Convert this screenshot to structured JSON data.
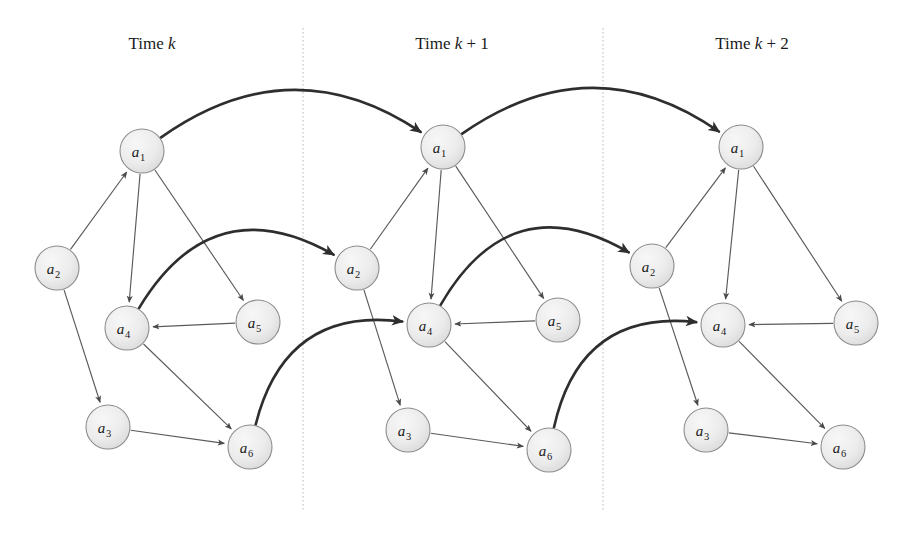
{
  "figure": {
    "background_color": "#ffffff",
    "node_fill": "#e9e9e9",
    "node_stroke": "#8c8c8c",
    "thin_edge_color": "#5a5a5a",
    "thick_edge_color": "#2e2e2e",
    "divider_color": "#b9b9b9",
    "node_radius": 22
  },
  "slices": [
    {
      "id": "slice-k",
      "label_prefix": "Time ",
      "label_var": "k",
      "label_suffix": "",
      "label_full": "Time k",
      "label_x": 152,
      "label_y": 45,
      "origin_x": 0,
      "nodes": [
        {
          "id": "a1",
          "letter": "a",
          "sub": "1",
          "x": 142,
          "y": 151
        },
        {
          "id": "a2",
          "letter": "a",
          "sub": "2",
          "x": 57,
          "y": 268
        },
        {
          "id": "a3",
          "letter": "a",
          "sub": "3",
          "x": 108,
          "y": 427
        },
        {
          "id": "a4",
          "letter": "a",
          "sub": "4",
          "x": 127,
          "y": 328
        },
        {
          "id": "a5",
          "letter": "a",
          "sub": "5",
          "x": 258,
          "y": 322
        },
        {
          "id": "a6",
          "letter": "a",
          "sub": "6",
          "x": 250,
          "y": 447
        }
      ]
    },
    {
      "id": "slice-k1",
      "label_prefix": "Time ",
      "label_var": "k",
      "label_suffix": " + 1",
      "label_full": "Time k + 1",
      "label_x": 452,
      "label_y": 45,
      "origin_x": 300,
      "nodes": [
        {
          "id": "a1",
          "letter": "a",
          "sub": "1",
          "x": 443,
          "y": 147
        },
        {
          "id": "a2",
          "letter": "a",
          "sub": "2",
          "x": 357,
          "y": 268
        },
        {
          "id": "a3",
          "letter": "a",
          "sub": "3",
          "x": 408,
          "y": 430
        },
        {
          "id": "a4",
          "letter": "a",
          "sub": "4",
          "x": 429,
          "y": 325
        },
        {
          "id": "a5",
          "letter": "a",
          "sub": "5",
          "x": 558,
          "y": 320
        },
        {
          "id": "a6",
          "letter": "a",
          "sub": "6",
          "x": 549,
          "y": 450
        }
      ]
    },
    {
      "id": "slice-k2",
      "label_prefix": "Time ",
      "label_var": "k",
      "label_suffix": " + 2",
      "label_full": "Time k + 2",
      "label_x": 752,
      "label_y": 45,
      "origin_x": 600,
      "nodes": [
        {
          "id": "a1",
          "letter": "a",
          "sub": "1",
          "x": 741,
          "y": 147
        },
        {
          "id": "a2",
          "letter": "a",
          "sub": "2",
          "x": 652,
          "y": 266
        },
        {
          "id": "a3",
          "letter": "a",
          "sub": "3",
          "x": 706,
          "y": 430
        },
        {
          "id": "a4",
          "letter": "a",
          "sub": "4",
          "x": 723,
          "y": 325
        },
        {
          "id": "a5",
          "letter": "a",
          "sub": "5",
          "x": 856,
          "y": 323
        },
        {
          "id": "a6",
          "letter": "a",
          "sub": "6",
          "x": 843,
          "y": 447
        }
      ]
    }
  ],
  "dividers": [
    {
      "id": "divider-1",
      "x": 303,
      "y1": 28,
      "y2": 510
    },
    {
      "id": "divider-2",
      "x": 603,
      "y1": 28,
      "y2": 510
    }
  ],
  "intra_slice_edges": [
    {
      "from": "a2",
      "to": "a1"
    },
    {
      "from": "a1",
      "to": "a4"
    },
    {
      "from": "a1",
      "to": "a5"
    },
    {
      "from": "a5",
      "to": "a4"
    },
    {
      "from": "a2",
      "to": "a3"
    },
    {
      "from": "a4",
      "to": "a6"
    },
    {
      "from": "a3",
      "to": "a6"
    }
  ],
  "inter_slice_edges": [
    {
      "id": "a1-a1-k-k1",
      "from_slice": 0,
      "from": "a1",
      "to_slice": 1,
      "to": "a1",
      "bow": -52
    },
    {
      "id": "a4-a2-k-k1",
      "from_slice": 0,
      "from": "a4",
      "to_slice": 1,
      "to": "a2",
      "bow": -58
    },
    {
      "id": "a6-a4-k-k1",
      "from_slice": 0,
      "from": "a6",
      "to_slice": 1,
      "to": "a4",
      "bow": -48
    },
    {
      "id": "a1-a1-k1-k2",
      "from_slice": 1,
      "from": "a1",
      "to_slice": 2,
      "to": "a1",
      "bow": -52
    },
    {
      "id": "a4-a2-k1-k2",
      "from_slice": 1,
      "from": "a4",
      "to_slice": 2,
      "to": "a2",
      "bow": -58
    },
    {
      "id": "a6-a4-k1-k2",
      "from_slice": 1,
      "from": "a6",
      "to_slice": 2,
      "to": "a4",
      "bow": -48
    }
  ]
}
